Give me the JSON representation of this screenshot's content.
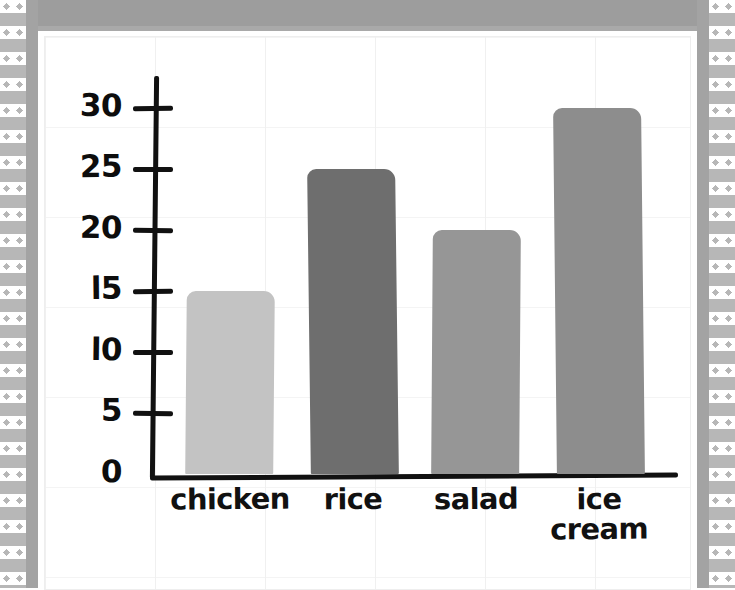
{
  "document": {
    "type": "worksheet-bar-chart-scan",
    "paper_color": "#ffffff",
    "frame_color": "#9d9d9d",
    "border_style": "zigzag"
  },
  "chart_data": {
    "type": "bar",
    "title": "",
    "subtitle": "",
    "xlabel": "",
    "ylabel": "",
    "categories": [
      "chicken",
      "rice",
      "salad",
      "ice cream"
    ],
    "values": [
      15,
      25,
      20,
      30
    ],
    "ylim": [
      0,
      32
    ],
    "yticks": [
      0,
      5,
      10,
      15,
      20,
      25,
      30
    ],
    "ytick_labels": [
      "0",
      "5",
      "l0",
      "l5",
      "20",
      "25",
      "30"
    ],
    "grid": true,
    "legend": null,
    "bar_colors": [
      "#c3c3c3",
      "#6e6e6e",
      "#969696",
      "#8d8d8d"
    ],
    "axis_color": "#111111",
    "style": "hand-drawn"
  },
  "axis": {
    "y_labels": [
      {
        "text": "30",
        "value": 30
      },
      {
        "text": "25",
        "value": 25
      },
      {
        "text": "20",
        "value": 20
      },
      {
        "text": "l5",
        "value": 15
      },
      {
        "text": "l0",
        "value": 10
      },
      {
        "text": "5",
        "value": 5
      },
      {
        "text": "0",
        "value": 0
      }
    ]
  },
  "bars": [
    {
      "label": "chicken",
      "label_line2": "",
      "value": 15,
      "color": "#c3c3c3"
    },
    {
      "label": "rice",
      "label_line2": "",
      "value": 25,
      "color": "#6e6e6e"
    },
    {
      "label": "salad",
      "label_line2": "",
      "value": 20,
      "color": "#969696"
    },
    {
      "label": "ice",
      "label_line2": "cream",
      "value": 30,
      "color": "#8d8d8d"
    }
  ]
}
